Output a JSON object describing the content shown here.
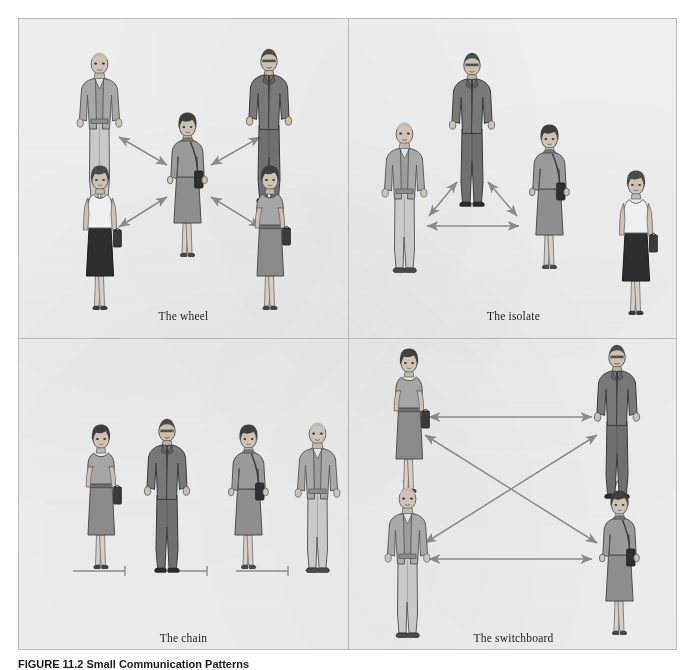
{
  "figure": {
    "caption_number": "FIGURE 11.2",
    "caption_text": "Small Communication Patterns",
    "background_color": "#f2f2f2",
    "border_color": "#b9b9b9",
    "arrow_color": "#8a8a8a",
    "connector_color": "#8a8a8a"
  },
  "panels": [
    {
      "id": "wheel",
      "caption": "The wheel",
      "position": "top-left",
      "description": "Four people arranged around one central woman; double-headed arrows connect each outer person to the center only.",
      "people": [
        {
          "role": "bald-man-grey-jacket",
          "slot": "upper-left"
        },
        {
          "role": "suited-man-dark",
          "slot": "upper-right"
        },
        {
          "role": "woman-white-top-black-skirt",
          "slot": "lower-left"
        },
        {
          "role": "woman-grey-dress-briefcase",
          "slot": "lower-right"
        },
        {
          "role": "woman-dark-dress-shoulder-bag",
          "slot": "center"
        }
      ],
      "links": [
        {
          "from": "center",
          "to": "upper-left",
          "style": "double-arrow"
        },
        {
          "from": "center",
          "to": "upper-right",
          "style": "double-arrow"
        },
        {
          "from": "center",
          "to": "lower-left",
          "style": "double-arrow"
        },
        {
          "from": "center",
          "to": "lower-right",
          "style": "double-arrow"
        }
      ]
    },
    {
      "id": "isolate",
      "caption": "The isolate",
      "position": "top-right",
      "description": "Three people linked in a triangle of double-headed arrows while a fourth woman at the far right is unconnected.",
      "people": [
        {
          "role": "suited-man-dark",
          "slot": "top-center"
        },
        {
          "role": "bald-man-grey-jacket",
          "slot": "left"
        },
        {
          "role": "woman-dark-dress-shoulder-bag",
          "slot": "right"
        },
        {
          "role": "woman-white-top-black-skirt",
          "slot": "isolate"
        }
      ],
      "links": [
        {
          "from": "top-center",
          "to": "left",
          "style": "double-arrow"
        },
        {
          "from": "top-center",
          "to": "right",
          "style": "double-arrow"
        },
        {
          "from": "left",
          "to": "right",
          "style": "double-arrow"
        }
      ]
    },
    {
      "id": "chain",
      "caption": "The chain",
      "position": "bottom-left",
      "description": "Four people standing in a single row, each joined to the next by a plain line connector with an end bar.",
      "people": [
        {
          "role": "woman-grey-dress-briefcase",
          "slot": "first"
        },
        {
          "role": "suited-man-dark",
          "slot": "second"
        },
        {
          "role": "woman-dark-dress-shoulder-bag",
          "slot": "third"
        },
        {
          "role": "bald-man-grey-jacket",
          "slot": "fourth"
        }
      ],
      "links": [
        {
          "from": "first",
          "to": "second",
          "style": "line-endbar"
        },
        {
          "from": "second",
          "to": "third",
          "style": "line-endbar"
        },
        {
          "from": "third",
          "to": "fourth",
          "style": "line-endbar"
        }
      ]
    },
    {
      "id": "switchboard",
      "caption": "The switchboard",
      "position": "bottom-right",
      "description": "Four people at the corners of a square; double-headed arrows run along all four sides and both diagonals.",
      "people": [
        {
          "role": "woman-grey-dress-briefcase",
          "slot": "top-left"
        },
        {
          "role": "suited-man-dark",
          "slot": "top-right"
        },
        {
          "role": "bald-man-grey-jacket",
          "slot": "bottom-left"
        },
        {
          "role": "woman-dark-dress-shoulder-bag",
          "slot": "bottom-right"
        }
      ],
      "links": [
        {
          "from": "top-left",
          "to": "top-right",
          "style": "double-arrow"
        },
        {
          "from": "bottom-left",
          "to": "bottom-right",
          "style": "double-arrow"
        },
        {
          "from": "top-left",
          "to": "bottom-left",
          "style": "double-arrow"
        },
        {
          "from": "top-right",
          "to": "bottom-right",
          "style": "double-arrow"
        },
        {
          "from": "top-left",
          "to": "bottom-right",
          "style": "double-arrow"
        },
        {
          "from": "top-right",
          "to": "bottom-left",
          "style": "double-arrow"
        }
      ]
    }
  ]
}
